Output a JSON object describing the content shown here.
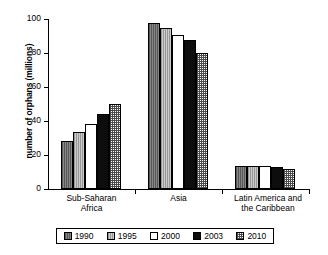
{
  "chart_data": {
    "type": "bar",
    "title": "",
    "xlabel": "",
    "ylabel": "number of orphans (millions)",
    "ylim": [
      0,
      100
    ],
    "yticks": [
      0,
      20,
      40,
      60,
      80,
      100
    ],
    "grid": false,
    "legend_position": "bottom",
    "categories": [
      "Sub-Saharan Africa",
      "Asia",
      "Latin America and the Caribbean"
    ],
    "category_lines": [
      [
        "Sub-Saharan",
        "Africa"
      ],
      [
        "Asia",
        ""
      ],
      [
        "Latin America and",
        "the Caribbean"
      ]
    ],
    "series": [
      {
        "name": "1990",
        "values": [
          28.5,
          97.5,
          13.5
        ],
        "fill": "dark-grey-vertical-lines",
        "color": "#777777"
      },
      {
        "name": "1995",
        "values": [
          33.5,
          95.0,
          13.5
        ],
        "fill": "light-grey-vertical-lines",
        "color": "#b9b9b9"
      },
      {
        "name": "2000",
        "values": [
          38.5,
          90.5,
          13.5
        ],
        "fill": "white",
        "color": "#ffffff"
      },
      {
        "name": "2003",
        "values": [
          44.0,
          87.5,
          13.0
        ],
        "fill": "solid-black",
        "color": "#0d0d0d"
      },
      {
        "name": "2010",
        "values": [
          50.0,
          80.0,
          12.0
        ],
        "fill": "checkerboard-hatch",
        "color": "#4b4b4b"
      }
    ]
  }
}
